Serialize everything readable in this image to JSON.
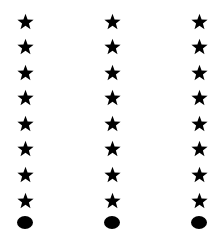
{
  "canvas": {
    "width": 224,
    "height": 245,
    "background": "#ffffff"
  },
  "figure": {
    "shape_color": "#000000",
    "columns": [
      {
        "id": "left",
        "center_x": 25,
        "items": [
          "star",
          "star",
          "star",
          "star",
          "star",
          "star",
          "star",
          "star",
          "oval"
        ]
      },
      {
        "id": "middle",
        "center_x": 112,
        "items": [
          "star",
          "star",
          "star",
          "star",
          "star",
          "star",
          "star",
          "star",
          "oval"
        ]
      },
      {
        "id": "right",
        "center_x": 199,
        "items": [
          "star",
          "star",
          "star",
          "star",
          "star",
          "star",
          "star",
          "star",
          "oval"
        ]
      }
    ],
    "row_centers_y": [
      21,
      46,
      72,
      97,
      123,
      148,
      174,
      200,
      222
    ],
    "star_size": 17,
    "oval_width": 16,
    "oval_height": 13,
    "counts": {
      "stars_per_column": 8,
      "ovals_per_column": 1,
      "total_stars": 24,
      "total_ovals": 3
    }
  }
}
